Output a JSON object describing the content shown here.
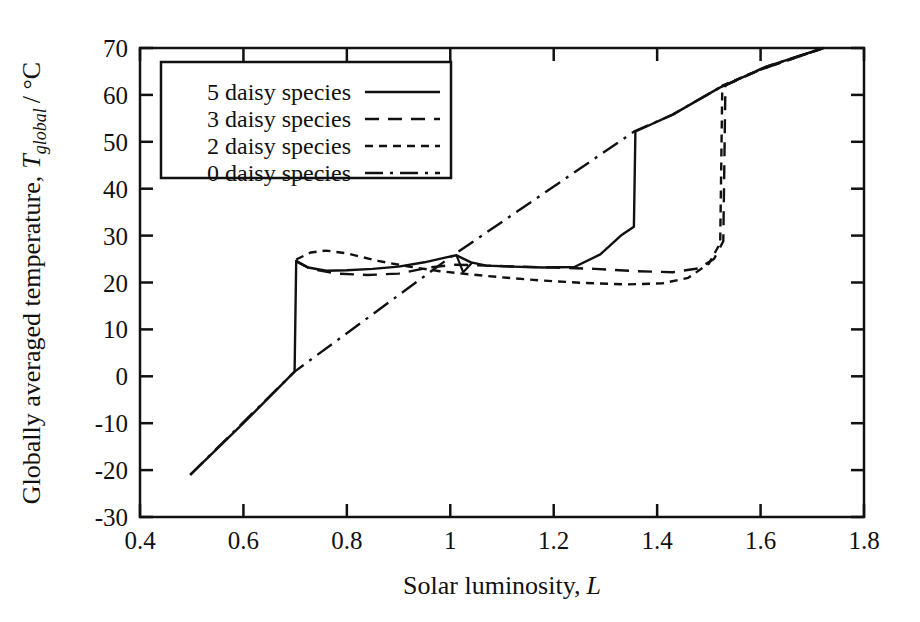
{
  "chart_data": {
    "type": "line",
    "title": "",
    "xlabel": "Solar luminosity, L",
    "xlabel_text": "Solar luminosity,",
    "xlabel_symbol": "L",
    "ylabel": "Globally averaged temperature, T_global / °C",
    "ylabel_lead": "Globally averaged temperature,",
    "ylabel_symbol": "T",
    "ylabel_subscript": "global",
    "ylabel_units": "/ °C",
    "xlim": [
      0.4,
      1.8
    ],
    "ylim": [
      -30,
      70
    ],
    "xticks": [
      0.4,
      0.6,
      0.8,
      1.0,
      1.2,
      1.4,
      1.6,
      1.8
    ],
    "xtick_labels": [
      "0.4",
      "0.6",
      "0.8",
      "1",
      "1.2",
      "1.4",
      "1.6",
      "1.8"
    ],
    "yticks": [
      -30,
      -20,
      -10,
      0,
      10,
      20,
      30,
      40,
      50,
      60,
      70
    ],
    "ytick_labels": [
      "-30",
      "-20",
      "-10",
      "0",
      "10",
      "20",
      "30",
      "40",
      "50",
      "60",
      "70"
    ],
    "grid": false,
    "legend_position": "upper-left",
    "line_color": "#111111",
    "series": [
      {
        "name": "5 daisy species",
        "dash": "solid",
        "dasharray": "none",
        "points": [
          [
            0.497,
            -21.0
          ],
          [
            0.6,
            -10.0
          ],
          [
            0.699,
            1.0
          ],
          [
            0.702,
            24.6
          ],
          [
            0.725,
            23.2
          ],
          [
            0.76,
            22.5
          ],
          [
            0.8,
            22.6
          ],
          [
            0.85,
            22.9
          ],
          [
            0.9,
            23.4
          ],
          [
            0.95,
            24.3
          ],
          [
            0.99,
            25.3
          ],
          [
            1.012,
            25.8
          ],
          [
            1.04,
            24.3
          ],
          [
            1.07,
            23.6
          ],
          [
            1.12,
            23.4
          ],
          [
            1.18,
            23.2
          ],
          [
            1.24,
            23.3
          ],
          [
            1.29,
            26.0
          ],
          [
            1.33,
            30.0
          ],
          [
            1.355,
            31.9
          ],
          [
            1.358,
            52.2
          ],
          [
            1.43,
            55.8
          ],
          [
            1.52,
            61.5
          ],
          [
            1.61,
            66.0
          ],
          [
            1.722,
            70.0
          ]
        ]
      },
      {
        "name": "3 daisy species",
        "dash": "dashed",
        "dasharray": "14,9",
        "points": [
          [
            0.702,
            24.5
          ],
          [
            0.73,
            22.9
          ],
          [
            0.78,
            21.9
          ],
          [
            0.84,
            21.6
          ],
          [
            0.9,
            21.9
          ],
          [
            0.96,
            23.2
          ],
          [
            1.01,
            23.8
          ],
          [
            1.07,
            23.6
          ],
          [
            1.13,
            23.4
          ],
          [
            1.2,
            23.2
          ],
          [
            1.28,
            22.9
          ],
          [
            1.36,
            22.4
          ],
          [
            1.43,
            22.2
          ],
          [
            1.48,
            23.0
          ],
          [
            1.51,
            25.0
          ],
          [
            1.528,
            28.8
          ],
          [
            1.532,
            62.0
          ],
          [
            1.6,
            65.4
          ],
          [
            1.722,
            70.0
          ]
        ]
      },
      {
        "name": "2 daisy species",
        "dash": "short-dashed",
        "dasharray": "8,6",
        "points": [
          [
            0.702,
            24.9
          ],
          [
            0.73,
            26.4
          ],
          [
            0.76,
            26.8
          ],
          [
            0.8,
            26.2
          ],
          [
            0.86,
            24.6
          ],
          [
            0.92,
            23.4
          ],
          [
            0.98,
            22.4
          ],
          [
            1.04,
            21.7
          ],
          [
            1.11,
            21.0
          ],
          [
            1.18,
            20.4
          ],
          [
            1.26,
            19.9
          ],
          [
            1.34,
            19.6
          ],
          [
            1.41,
            19.8
          ],
          [
            1.46,
            21.0
          ],
          [
            1.5,
            24.0
          ],
          [
            1.522,
            28.4
          ],
          [
            1.526,
            62.0
          ],
          [
            1.6,
            65.4
          ],
          [
            1.722,
            70.0
          ]
        ]
      },
      {
        "name": "0 daisy species",
        "dash": "dash-dot",
        "dasharray": "18,7,3,7",
        "points": [
          [
            0.497,
            -21.0
          ],
          [
            0.699,
            1.0
          ],
          [
            1.0,
            25.4
          ],
          [
            1.357,
            52.3
          ],
          [
            1.43,
            55.8
          ],
          [
            1.52,
            61.5
          ],
          [
            1.61,
            66.0
          ],
          [
            1.722,
            70.0
          ]
        ]
      }
    ],
    "annotation_spike": {
      "name": "small-notch",
      "points": [
        [
          1.012,
          25.8
        ],
        [
          1.025,
          22.2
        ],
        [
          1.043,
          24.3
        ]
      ]
    },
    "legend": {
      "entries": [
        {
          "label": "5 daisy species",
          "dash": "solid"
        },
        {
          "label": "3 daisy species",
          "dash": "dashed"
        },
        {
          "label": "2 daisy species",
          "dash": "short-dashed"
        },
        {
          "label": "0 daisy species",
          "dash": "dash-dot"
        }
      ]
    }
  }
}
